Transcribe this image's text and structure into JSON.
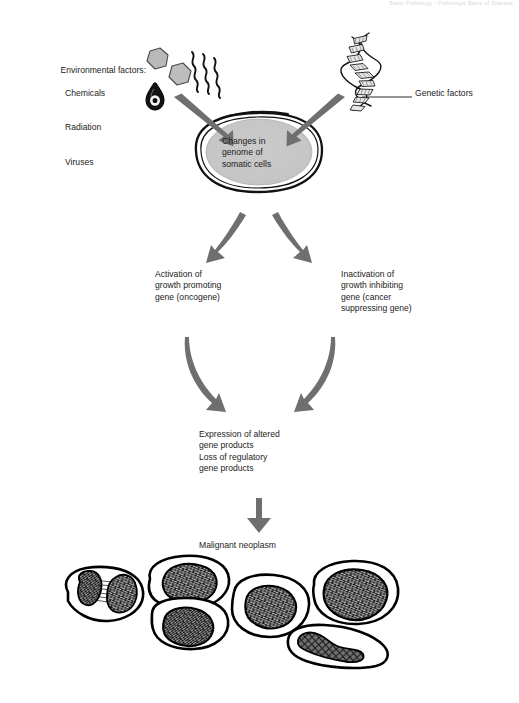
{
  "figure": {
    "header_note": "Basic Pathology / Pathologic Basis of Disease"
  },
  "labels": {
    "environmental": {
      "heading": "Environmental factors:",
      "items": [
        "Chemicals",
        "Radiation",
        "Viruses"
      ]
    },
    "genetic": "Genetic factors",
    "nucleus": "Changes in\ngenome of\nsomatic cells",
    "branch_left": "Activation of\ngrowth promoting\ngene (oncogene)",
    "branch_right": "Inactivation of\ngrowth inhibiting\ngene (cancer\nsuppressing gene)",
    "expression": "Expression of altered\ngene products\nLoss of regulatory\ngene products",
    "neoplasm": "Malignant neoplasm"
  },
  "icons": {
    "chemical_hexagon": "hexagon-icon",
    "radiation_waves": "wavy-lines-icon",
    "virus_droplet": "virus-icon",
    "dna_helix": "dna-helix-icon",
    "cell_outline": "cell-icon",
    "nucleus": "nucleus-icon",
    "arrow": "arrow-icon",
    "tumor_cluster": "tumor-cell-cluster-icon"
  },
  "colors": {
    "arrow_gray": "#6f6f6f",
    "nucleus_fill": "#c8c8c8",
    "hexagon_fill": "#bdbdbd",
    "ink": "#1a1a1a",
    "background": "#ffffff"
  }
}
